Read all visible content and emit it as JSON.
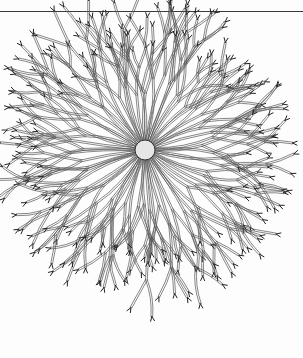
{
  "illustration": {
    "subject": "radiating branched organism line drawing",
    "center": [
      145,
      150
    ],
    "stroke_color": "#555555",
    "body_fill": "#e6e6e6",
    "arm_count": 64,
    "radius": 130
  },
  "rule": {
    "y": 11,
    "color": "#3a3a3a"
  }
}
